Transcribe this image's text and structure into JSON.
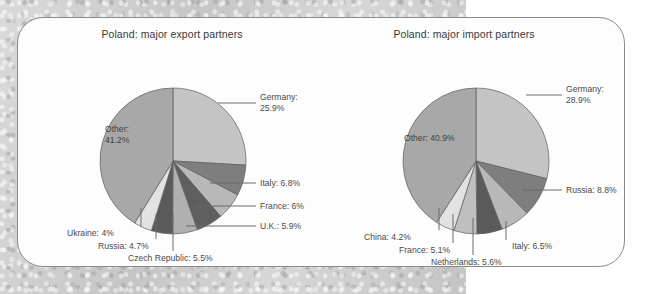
{
  "page": {
    "background_color": "#c9c9c9",
    "card_background": "#fdfdfd",
    "card_border_color": "#8a8a8a"
  },
  "chart_data": [
    {
      "type": "pie",
      "id": "export",
      "title": "Poland: major export partners",
      "categories": [
        "Germany",
        "Italy",
        "France",
        "U.K.",
        "Czech Republic",
        "Russia",
        "Ukraine",
        "Other"
      ],
      "values": [
        25.9,
        6.8,
        6.0,
        5.9,
        5.5,
        4.7,
        4.0,
        41.2
      ],
      "labels": [
        "Germany: 25.9%",
        "Italy: 6.8%",
        "France: 6%",
        "U.K.: 5.9%",
        "Czech Republic: 5.5%",
        "Russia: 4.7%",
        "Ukraine: 4%",
        "Other: 41.2%"
      ],
      "label_germany_line1": "Germany:",
      "label_germany_line2": "25.9%",
      "label_other_line1": "Other:",
      "label_other_line2": "41.2%",
      "label_italy": "Italy: 6.8%",
      "label_france": "France: 6%",
      "label_uk": "U.K.: 5.9%",
      "label_czech": "Czech Republic: 5.5%",
      "label_russia": "Russia: 4.7%",
      "label_ukraine": "Ukraine: 4%",
      "colors": [
        "#c4c4c4",
        "#7e7e7e",
        "#b8b8b8",
        "#5e5e5e",
        "#b0b0b0",
        "#5a5a5a",
        "#e2e2e2",
        "#a8a8a8"
      ],
      "legend": "none",
      "grid": false
    },
    {
      "type": "pie",
      "id": "import",
      "title": "Poland: major import partners",
      "categories": [
        "Germany",
        "Russia",
        "Italy",
        "Netherlands",
        "France",
        "China",
        "Other"
      ],
      "values": [
        28.9,
        8.8,
        6.5,
        5.6,
        5.1,
        4.2,
        40.9
      ],
      "labels": [
        "Germany: 28.9%",
        "Russia: 8.8%",
        "Italy: 6.5%",
        "Netherlands: 5.6%",
        "France: 5.1%",
        "China: 4.2%",
        "Other: 40.9%"
      ],
      "label_germany_line1": "Germany:",
      "label_germany_line2": "28.9%",
      "label_other": "Other: 40.9%",
      "label_russia": "Russia: 8.8%",
      "label_italy": "Italy: 6.5%",
      "label_netherlands": "Netherlands: 5.6%",
      "label_france": "France: 5.1%",
      "label_china": "China: 4.2%",
      "colors": [
        "#c4c4c4",
        "#7e7e7e",
        "#b8b8b8",
        "#5a5a5a",
        "#bfbfbf",
        "#e2e2e2",
        "#a8a8a8"
      ],
      "legend": "none",
      "grid": false
    }
  ]
}
